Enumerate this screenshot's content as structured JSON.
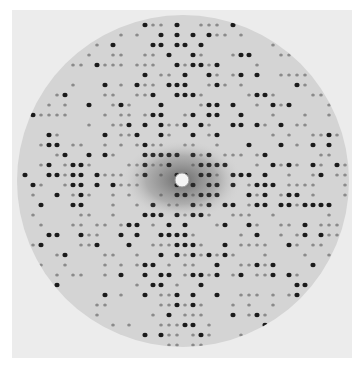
{
  "image": {
    "subject": "X-ray diffraction pattern",
    "colors": {
      "background": "#ffffff",
      "plate": "#ececec",
      "film": "#cfcfcf",
      "spot": "#1a1a1a",
      "beamstop": "#f4f4f4"
    },
    "film_circle": {
      "cx": 183,
      "cy": 181,
      "r": 166
    },
    "beamstop": {
      "cx": 182,
      "cy": 180,
      "r": 7
    },
    "row_spacing": 10,
    "spot_spacing": 8
  }
}
